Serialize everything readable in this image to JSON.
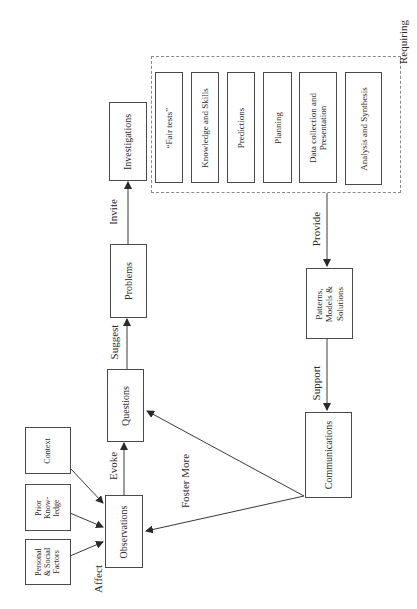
{
  "diagram": {
    "nodes": {
      "context": "Context",
      "prior_knowledge": "Prior\nKnow-\nledge",
      "personal_social": "Personal\n& Social\nFactors",
      "observations": "Observations",
      "questions": "Questions",
      "problems": "Problems",
      "investigations": "Investigations",
      "patterns": "Patterns,\nModels &\nSolutions",
      "communications": "Communications"
    },
    "requiring_group": {
      "label": "Requiring",
      "items": [
        "“Fair tests”",
        "Knowledge and Skills",
        "Predictions",
        "Planning",
        "Data collection and\nPresentation",
        "Analysis and Synthesis"
      ]
    },
    "edge_labels": {
      "affect": "Affect",
      "evoke": "Evoke",
      "suggest": "Suggest",
      "invite": "Invite",
      "provide": "Provide",
      "support": "Support",
      "foster_more": "Foster More"
    },
    "colors": {
      "line": "#3a3a3a",
      "dashed_border": "#8a8a8a"
    }
  }
}
